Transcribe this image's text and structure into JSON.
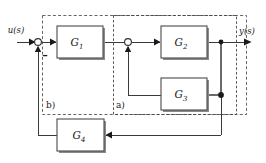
{
  "diagram": {
    "type": "block-diagram",
    "signals": {
      "input_label": "u(s)",
      "output_label": "y(s)",
      "feedback_sign": "–"
    },
    "blocks": [
      {
        "id": "G1",
        "base": "G",
        "subscript": "1",
        "label": "G₁"
      },
      {
        "id": "G2",
        "base": "G",
        "subscript": "2",
        "label": "G₂"
      },
      {
        "id": "G3",
        "base": "G",
        "subscript": "3",
        "label": "G₃"
      },
      {
        "id": "G4",
        "base": "G",
        "subscript": "4",
        "label": "G₄"
      }
    ],
    "regions": [
      {
        "id": "a",
        "label": "a)"
      },
      {
        "id": "b",
        "label": "b)"
      }
    ],
    "colors": {
      "line": "#3a3a3a",
      "block_stroke": "#4a4a4a",
      "block_fill": "#ffffff",
      "dash_stroke": "#555555",
      "background": "#ffffff",
      "text": "#1a1a1a"
    }
  }
}
